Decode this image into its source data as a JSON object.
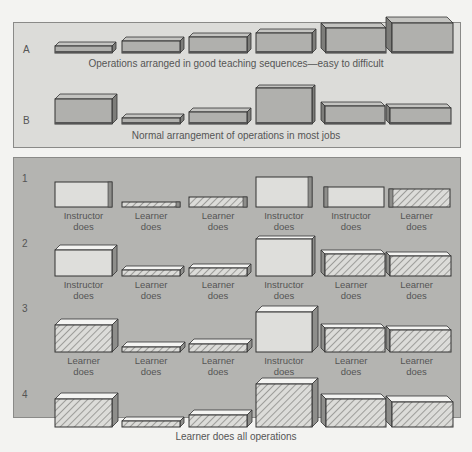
{
  "diagram": {
    "top_panel": {
      "rows": [
        {
          "label": "A",
          "caption": "Operations arranged in good teaching sequences—easy to difficult"
        },
        {
          "label": "B",
          "caption": "Normal arrangement of operations in most jobs"
        }
      ]
    },
    "bottom_panel": {
      "rows": [
        {
          "label": "1",
          "boxes": [
            "Instructor does",
            "Learner does",
            "Learner does",
            "Instructor does",
            "Instructor does",
            "Learner does"
          ]
        },
        {
          "label": "2",
          "boxes": [
            "Instructor does",
            "Learner does",
            "Learner does",
            "Instructor does",
            "Learner does",
            "Learner does"
          ]
        },
        {
          "label": "3",
          "boxes": [
            "Learner does",
            "Learner does",
            "Learner does",
            "Instructor does",
            "Learner does",
            "Learner does"
          ]
        },
        {
          "label": "4",
          "caption": "Learner does all operations"
        }
      ]
    },
    "legend_styles": {
      "operation_fill": "#b0b0ad",
      "instructor_fill": "#dededb",
      "learner_fill": "hatched",
      "edge_color": "#333333"
    }
  }
}
